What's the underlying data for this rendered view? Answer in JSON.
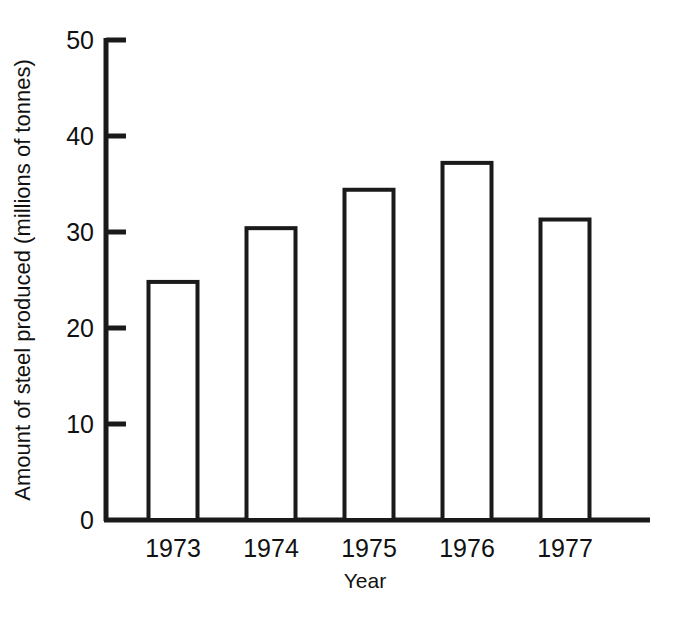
{
  "chart_data": {
    "type": "bar",
    "title": "",
    "subtitle": "",
    "xlabel": "Year",
    "ylabel": "Amount of steel produced (millions of tonnes)",
    "categories": [
      "1973",
      "1974",
      "1975",
      "1976",
      "1977"
    ],
    "values": [
      24.8,
      30.4,
      34.4,
      37.2,
      31.3
    ],
    "series": [
      {
        "name": "Amount of steel produced",
        "values": [
          24.8,
          30.4,
          34.4,
          37.2,
          31.3
        ]
      }
    ],
    "ylim": [
      0,
      50
    ],
    "yticks": [
      0,
      10,
      20,
      30,
      40,
      50
    ],
    "ytick_labels": [
      "0",
      "10",
      "20",
      "30",
      "40",
      "50"
    ],
    "grid": false,
    "legend": false,
    "legend_position": "none",
    "bar_style": "outline",
    "bar_fill_color": "#ffffff",
    "bar_edge_color": "#1a1a1a",
    "axis_color": "#1a1a1a",
    "background_color": "#ffffff",
    "tick_direction": "in"
  }
}
